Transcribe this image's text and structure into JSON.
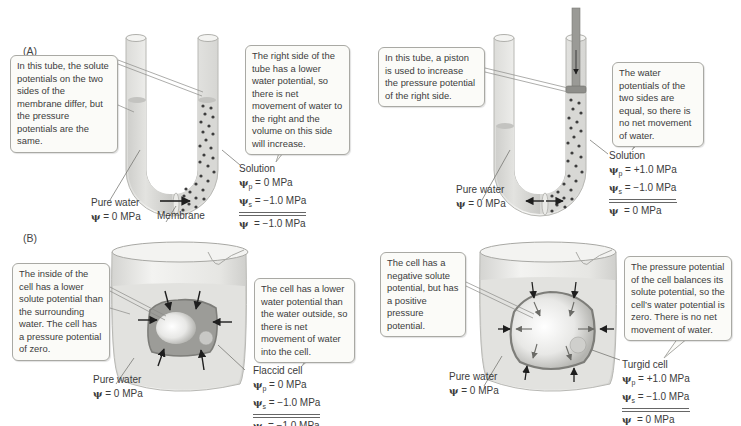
{
  "panels": {
    "A": {
      "label": "(A)",
      "left": {
        "callout_left": "In this tube, the solute potentials on the two sides of the membrane differ, but the pressure potentials are the same.",
        "callout_right": "The right side of the tube has a lower water potential, so there is net movement of water to the right and the volume on this side will increase.",
        "pure_water_label": "Pure water",
        "pure_water_psi": "= 0 MPa",
        "membrane_label": "Membrane",
        "solution_label": "Solution",
        "psi_p": "= 0 MPa",
        "psi_s": "= −1.0 MPa",
        "psi_total": "= −1.0 MPa"
      },
      "right": {
        "callout_left": "In this tube, a piston is used to increase the pressure potential of the right side.",
        "callout_right": "The water potentials of the two sides are equal, so there is no net movement of water.",
        "pure_water_label": "Pure water",
        "pure_water_psi": "= 0 MPa",
        "solution_label": "Solution",
        "psi_p": "= +1.0 MPa",
        "psi_s": "= −1.0 MPa",
        "psi_total": "= 0 MPa"
      }
    },
    "B": {
      "label": "(B)",
      "left": {
        "callout_left": "The inside of the cell has a lower solute potential than the surrounding water. The cell has a pressure potential of zero.",
        "callout_right": "The cell has a lower water potential than the water outside, so there is net movement of water into the cell.",
        "pure_water_label": "Pure water",
        "pure_water_psi": "= 0 MPa",
        "cell_label": "Flaccid cell",
        "psi_p": "= 0 MPa",
        "psi_s": "= −1.0 MPa",
        "psi_total": "= −1.0 MPa"
      },
      "right": {
        "callout_left": "The cell has a negative solute potential, but has a positive pressure potential.",
        "callout_right": "The pressure potential of the cell balances its solute potential, so the cell’s water potential is zero. There is no net movement of water.",
        "pure_water_label": "Pure water",
        "pure_water_psi": "= 0 MPa",
        "cell_label": "Turgid cell",
        "psi_p": "= +1.0 MPa",
        "psi_s": "= −1.0 MPa",
        "psi_total": "= 0 MPa"
      }
    }
  },
  "symbols": {
    "psi": "ψ",
    "sub_p": "p",
    "sub_s": "s"
  },
  "colors": {
    "water": "#d9d9d6",
    "tube_glass": "#ececea",
    "solute_dot": "#3d3d3d",
    "cell_wall": "#7d7d79",
    "callout_border": "#a9a9a4",
    "arrow": "#1e1e1e"
  }
}
